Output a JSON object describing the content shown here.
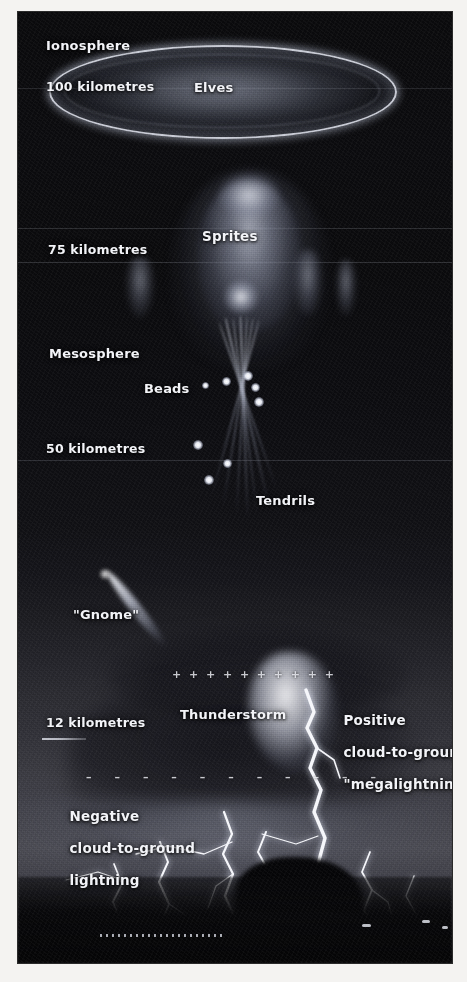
{
  "figure": {
    "kind": "atmospheric-electricity-diagram",
    "background_color": "#0a0a0c",
    "label_color": "#f3f4f8"
  },
  "altitude_labels": [
    {
      "id": "km100",
      "text": "100 kilometres",
      "y": 75
    },
    {
      "id": "km75",
      "text": "75 kilometres",
      "y": 238
    },
    {
      "id": "km50",
      "text": "50 kilometres",
      "y": 437
    },
    {
      "id": "km12",
      "text": "12 kilometres",
      "y": 711
    }
  ],
  "layer_labels": [
    {
      "id": "ionosphere",
      "text": "Ionosphere",
      "y": 33
    },
    {
      "id": "mesosphere",
      "text": "Mesosphere",
      "y": 341
    }
  ],
  "feature_labels": [
    {
      "id": "elves",
      "text": "Elves"
    },
    {
      "id": "sprites",
      "text": "Sprites"
    },
    {
      "id": "beads",
      "text": "Beads"
    },
    {
      "id": "tendrils",
      "text": "Tendrils"
    },
    {
      "id": "gnome",
      "text": "\"Gnome\""
    },
    {
      "id": "thunderstorm",
      "text": "Thunderstorm"
    }
  ],
  "discharge_labels": [
    {
      "id": "positive-megalightning",
      "lines": [
        "Positive",
        "cloud-to-ground",
        "\"megalightning\""
      ]
    },
    {
      "id": "negative-cloud-to-ground",
      "lines": [
        "Negative",
        "cloud-to-ground",
        "lightning"
      ]
    }
  ],
  "charge_rows": [
    {
      "id": "positive-charge-row",
      "symbol": "+",
      "count": 10
    },
    {
      "id": "negative-charge-row",
      "symbol": "–",
      "count": 11
    }
  ],
  "chart_data": {
    "type": "diagram",
    "ylabel": "Altitude",
    "y_unit": "kilometres",
    "ylim": [
      0,
      110
    ],
    "y_ticks": [
      12,
      50,
      75,
      100
    ],
    "y_tick_labels": [
      "12 kilometres",
      "50 kilometres",
      "75 kilometres",
      "100 kilometres"
    ],
    "grid": true,
    "annotations": [
      {
        "label": "Ionosphere",
        "altitude_km": 100,
        "type": "layer"
      },
      {
        "label": "Elves",
        "altitude_km": 100,
        "type": "event"
      },
      {
        "label": "Sprites",
        "altitude_km": 75,
        "type": "event"
      },
      {
        "label": "Mesosphere",
        "altitude_km": 62,
        "type": "layer"
      },
      {
        "label": "Beads",
        "altitude_km": 56,
        "type": "event"
      },
      {
        "label": "Tendrils",
        "altitude_km": 45,
        "type": "event"
      },
      {
        "label": "\"Gnome\"",
        "altitude_km": 20,
        "type": "event"
      },
      {
        "label": "Thunderstorm",
        "altitude_km": 12,
        "type": "feature"
      },
      {
        "label": "Positive cloud-to-ground \"megalightning\"",
        "altitude_km": 10,
        "type": "discharge"
      },
      {
        "label": "Negative cloud-to-ground lightning",
        "altitude_km": 6,
        "type": "discharge"
      }
    ]
  },
  "sprites": {
    "side_columns": 3,
    "main_bead_count": 8,
    "tendril_count": 7
  }
}
